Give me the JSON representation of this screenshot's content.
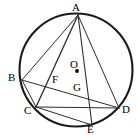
{
  "figure": {
    "stroke_color": "#1a1a1a",
    "chord_color": "#2b2b2b",
    "background_color": "#ffffff",
    "label_color": "#000000"
  },
  "circle": {
    "name": "circumscribed-circle",
    "cx": 76,
    "cy": 70,
    "r": 56.5,
    "stroke_width": 2.1
  },
  "center": {
    "label": "O",
    "dot_x": 77,
    "dot_y": 71,
    "dot_r": 1.9,
    "label_x": 70,
    "label_y": 59
  },
  "points": [
    {
      "id": "A",
      "label": "A",
      "x": 78,
      "y": 15,
      "label_x": 72,
      "label_y": 2
    },
    {
      "id": "B",
      "label": "B",
      "x": 22,
      "y": 80,
      "label_x": 8,
      "label_y": 72
    },
    {
      "id": "C",
      "label": "C",
      "x": 36,
      "y": 107,
      "label_x": 24,
      "label_y": 105
    },
    {
      "id": "D",
      "label": "D",
      "x": 119,
      "y": 108,
      "label_x": 122,
      "label_y": 104
    },
    {
      "id": "E",
      "label": "E",
      "x": 92,
      "y": 125,
      "label_x": 87,
      "label_y": 124
    },
    {
      "id": "F",
      "label": "F",
      "x": 52,
      "y": 85,
      "label_x": 52,
      "label_y": 74
    },
    {
      "id": "G",
      "label": "G",
      "x": 77,
      "y": 93,
      "label_x": 73,
      "label_y": 82
    }
  ],
  "segments": [
    {
      "name": "segment-AB",
      "from": "A",
      "to": "B",
      "width": 1.0
    },
    {
      "name": "segment-AC",
      "from": "A",
      "to": "C",
      "width": 1.3
    },
    {
      "name": "segment-AE",
      "from": "A",
      "to": "E",
      "width": 1.1
    },
    {
      "name": "segment-AD",
      "from": "A",
      "to": "D",
      "width": 1.0
    },
    {
      "name": "segment-BD",
      "from": "B",
      "to": "D",
      "width": 1.0
    },
    {
      "name": "segment-CD",
      "from": "C",
      "to": "D",
      "width": 1.0
    },
    {
      "name": "segment-CE",
      "from": "C",
      "to": "E",
      "width": 1.0
    },
    {
      "name": "segment-BC",
      "from": "B",
      "to": "C",
      "width": 1.0
    }
  ]
}
